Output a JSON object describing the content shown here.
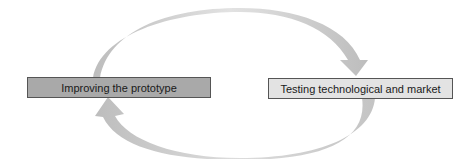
{
  "diagram": {
    "type": "cycle",
    "nodes": [
      {
        "id": "improve",
        "label": "Improving the prototype",
        "fill": "#a9a9a9"
      },
      {
        "id": "test",
        "label": "Testing technological and market",
        "fill": "#e3e3e3"
      }
    ],
    "edges": [
      {
        "from": "improve",
        "to": "test",
        "path": "top-arc",
        "color": "#c8c8c8"
      },
      {
        "from": "test",
        "to": "improve",
        "path": "bottom-arc",
        "color": "#c8c8c8"
      }
    ]
  }
}
